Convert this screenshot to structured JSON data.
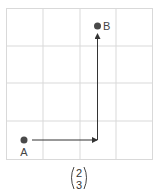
{
  "diagram": {
    "grid": {
      "columns": 4,
      "rows": 4,
      "line_color": "#d9d9d9"
    },
    "points": [
      {
        "label": "A",
        "cell_x": 0.5,
        "cell_y": 0.5
      },
      {
        "label": "B",
        "cell_x": 2.5,
        "cell_y": 3.5
      }
    ],
    "arrows": [
      {
        "from": "A",
        "direction": "right",
        "units": 2
      },
      {
        "direction": "up",
        "units": 3,
        "ends_at": "B"
      }
    ],
    "point_color": "#4a4a4a",
    "arrow_color": "#333333",
    "vector": {
      "top": "2",
      "bottom": "3"
    }
  }
}
